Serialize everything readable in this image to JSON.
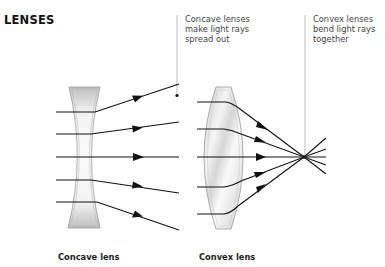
{
  "title": "LENSES",
  "notes": {
    "concave": "Concave lenses\nmake light rays\nspread out",
    "convex": "Convex lenses\nbend light rays\ntogether"
  },
  "captions": {
    "concave": "Concave lens",
    "convex": "Convex lens"
  },
  "colors": {
    "ray": "#111111",
    "callout_line": "#bbbbbb",
    "lens_outline": "#999999",
    "lens_fill": "#f4f4f4",
    "lens_shade": "#c8c8c8"
  },
  "diagram": {
    "concave_lens": {
      "incoming_rays": 5,
      "behavior": "diverge"
    },
    "convex_lens": {
      "incoming_rays": 5,
      "behavior": "converge",
      "focal_point": "single point right of lens"
    }
  }
}
